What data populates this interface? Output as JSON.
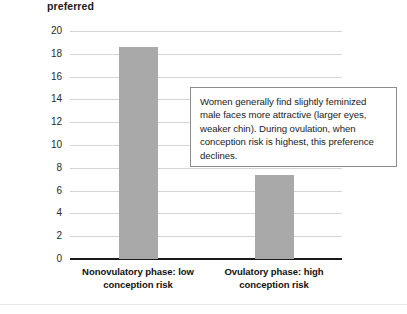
{
  "chart_data": {
    "type": "bar",
    "title": "preferred",
    "xlabel": "",
    "ylabel": "",
    "categories": [
      "Nonovulatory phase: low conception risk",
      "Ovulatory phase: high conception risk"
    ],
    "category_lines": [
      [
        "Nonovulatory phase: low",
        "conception risk"
      ],
      [
        "Ovulatory phase: high",
        "conception risk"
      ]
    ],
    "values": [
      18.6,
      7.4
    ],
    "ylim": [
      0,
      20
    ],
    "yticks": [
      20,
      18,
      16,
      14,
      12,
      10,
      8,
      6,
      4,
      2,
      0
    ],
    "grid": true,
    "legend": "none",
    "bar_color": "#a9a9a9",
    "axis_color": "#1a1a1a",
    "grid_color": "#d4d4d4"
  },
  "annotation": {
    "text": "Women generally find slightly feminized male faces more attractive (larger eyes, weaker chin). During ovulation, when conception risk is highest, this preference declines.",
    "border_color": "#8c8c8c"
  }
}
